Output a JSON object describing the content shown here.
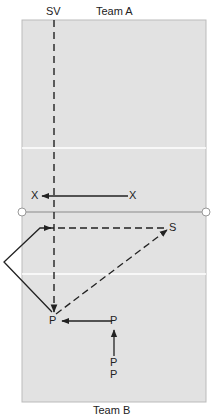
{
  "diagram": {
    "top_label": "Team A",
    "sv_label": "SV",
    "bottom_label": "Team B",
    "colors": {
      "court": "#e2e2e2",
      "lines": "#ffffff",
      "net": "#8a8a8a",
      "ink": "#222222"
    },
    "players": {
      "x_left": "X",
      "x_right": "X",
      "setter": "S",
      "p_left": "P",
      "p_mid": "P",
      "p_bottom_1": "P",
      "p_bottom_2": "P"
    }
  }
}
